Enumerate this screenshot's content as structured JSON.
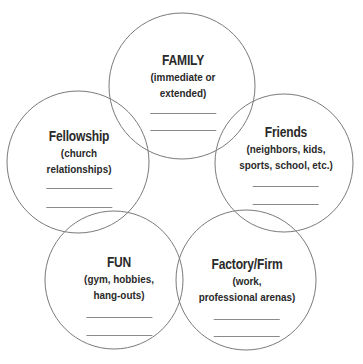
{
  "diagram": {
    "type": "overlapping-circles",
    "stroke_color": "#7a7a7a",
    "circles": [
      {
        "id": "family",
        "title": "FAMILY",
        "subtitle_lines": [
          "(immediate or",
          "extended)"
        ],
        "blank_lines": 2
      },
      {
        "id": "fellowship",
        "title": "Fellowship",
        "subtitle_lines": [
          "(church",
          "relationships)"
        ],
        "blank_lines": 2
      },
      {
        "id": "friends",
        "title": "Friends",
        "subtitle_lines": [
          "(neighbors, kids,",
          "sports, school, etc.)"
        ],
        "blank_lines": 2
      },
      {
        "id": "fun",
        "title": "FUN",
        "subtitle_lines": [
          "(gym, hobbies,",
          "hang-outs)"
        ],
        "blank_lines": 2
      },
      {
        "id": "factory",
        "title": "Factory/Firm",
        "subtitle_lines": [
          "(work,",
          "professional arenas)"
        ],
        "blank_lines": 2
      }
    ]
  }
}
